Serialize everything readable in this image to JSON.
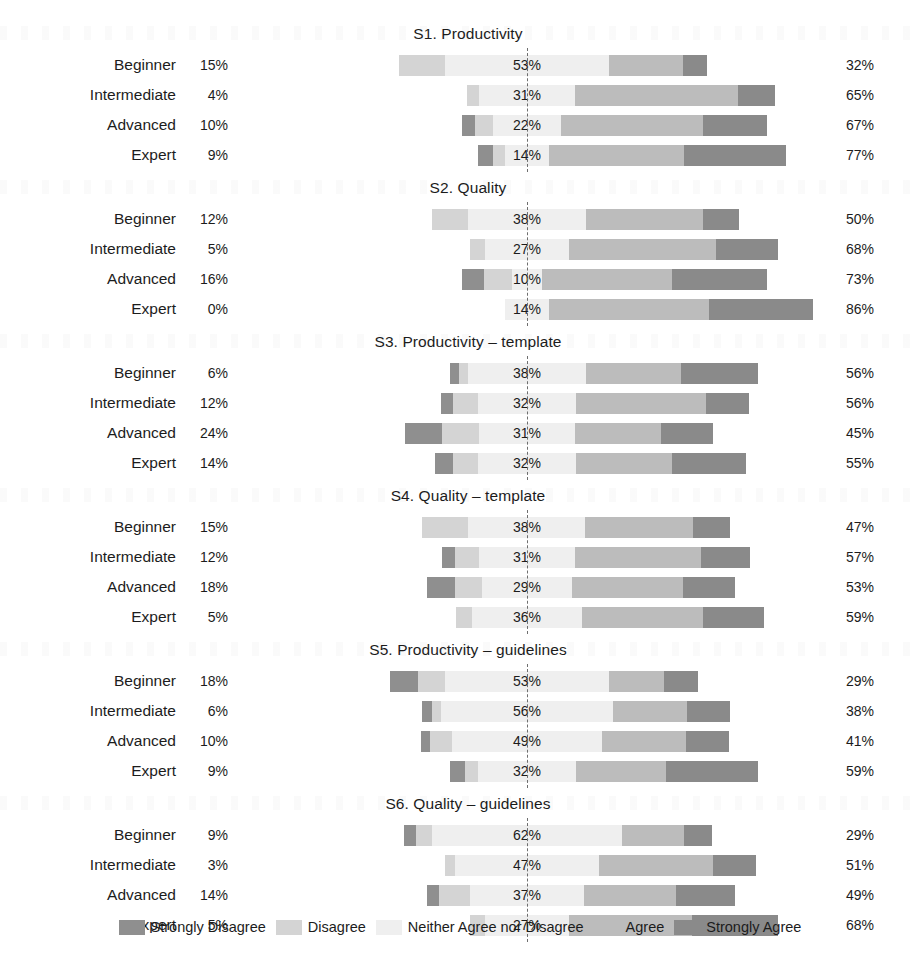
{
  "chart_data": {
    "type": "bar",
    "subtype": "diverging-stacked-likert",
    "title": "",
    "xlabel": "",
    "ylabel": "",
    "grid": false,
    "legend_position": "bottom",
    "categories": [
      "Beginner",
      "Intermediate",
      "Advanced",
      "Expert"
    ],
    "response_levels": [
      "Strongly Disagree",
      "Disagree",
      "Neither Agree nor Disagree",
      "Agree",
      "Strongly Agree"
    ],
    "level_colors": [
      "#8f8f8f",
      "#d4d4d4",
      "#efefef",
      "#bcbcbc",
      "#8a8a8a"
    ],
    "value_unit": "%",
    "panels": [
      {
        "title": "S1. Productivity",
        "rows": [
          {
            "label": "Beginner",
            "disagree_total": "15%",
            "neutral": "53%",
            "agree_total": "32%",
            "strongly_disagree": 0,
            "disagree": 15,
            "neither": 53,
            "agree": 24,
            "strongly_agree": 8
          },
          {
            "label": "Intermediate",
            "disagree_total": "4%",
            "neutral": "31%",
            "agree_total": "65%",
            "strongly_disagree": 0,
            "disagree": 4,
            "neither": 31,
            "agree": 53,
            "strongly_agree": 12
          },
          {
            "label": "Advanced",
            "disagree_total": "10%",
            "neutral": "22%",
            "agree_total": "67%",
            "strongly_disagree": 4,
            "disagree": 6,
            "neither": 22,
            "agree": 46,
            "strongly_agree": 21
          },
          {
            "label": "Expert",
            "disagree_total": "9%",
            "neutral": "14%",
            "agree_total": "77%",
            "strongly_disagree": 5,
            "disagree": 4,
            "neither": 14,
            "agree": 44,
            "strongly_agree": 33
          }
        ]
      },
      {
        "title": "S2. Quality",
        "rows": [
          {
            "label": "Beginner",
            "disagree_total": "12%",
            "neutral": "38%",
            "agree_total": "50%",
            "strongly_disagree": 0,
            "disagree": 12,
            "neither": 38,
            "agree": 38,
            "strongly_agree": 12
          },
          {
            "label": "Intermediate",
            "disagree_total": "5%",
            "neutral": "27%",
            "agree_total": "68%",
            "strongly_disagree": 0,
            "disagree": 5,
            "neither": 27,
            "agree": 48,
            "strongly_agree": 20
          },
          {
            "label": "Advanced",
            "disagree_total": "16%",
            "neutral": "10%",
            "agree_total": "73%",
            "strongly_disagree": 7,
            "disagree": 9,
            "neither": 10,
            "agree": 42,
            "strongly_agree": 31
          },
          {
            "label": "Expert",
            "disagree_total": "0%",
            "neutral": "14%",
            "agree_total": "86%",
            "strongly_disagree": 0,
            "disagree": 0,
            "neither": 14,
            "agree": 52,
            "strongly_agree": 34
          }
        ]
      },
      {
        "title": "S3. Productivity – template",
        "rows": [
          {
            "label": "Beginner",
            "disagree_total": "6%",
            "neutral": "38%",
            "agree_total": "56%",
            "strongly_disagree": 3,
            "disagree": 3,
            "neither": 38,
            "agree": 31,
            "strongly_agree": 25
          },
          {
            "label": "Intermediate",
            "disagree_total": "12%",
            "neutral": "32%",
            "agree_total": "56%",
            "strongly_disagree": 4,
            "disagree": 8,
            "neither": 32,
            "agree": 42,
            "strongly_agree": 14
          },
          {
            "label": "Advanced",
            "disagree_total": "24%",
            "neutral": "31%",
            "agree_total": "45%",
            "strongly_disagree": 12,
            "disagree": 12,
            "neither": 31,
            "agree": 28,
            "strongly_agree": 17
          },
          {
            "label": "Expert",
            "disagree_total": "14%",
            "neutral": "32%",
            "agree_total": "55%",
            "strongly_disagree": 6,
            "disagree": 8,
            "neither": 32,
            "agree": 31,
            "strongly_agree": 24
          }
        ]
      },
      {
        "title": "S4. Quality – template",
        "rows": [
          {
            "label": "Beginner",
            "disagree_total": "15%",
            "neutral": "38%",
            "agree_total": "47%",
            "strongly_disagree": 0,
            "disagree": 15,
            "neither": 38,
            "agree": 35,
            "strongly_agree": 12
          },
          {
            "label": "Intermediate",
            "disagree_total": "12%",
            "neutral": "31%",
            "agree_total": "57%",
            "strongly_disagree": 4,
            "disagree": 8,
            "neither": 31,
            "agree": 41,
            "strongly_agree": 16
          },
          {
            "label": "Advanced",
            "disagree_total": "18%",
            "neutral": "29%",
            "agree_total": "53%",
            "strongly_disagree": 9,
            "disagree": 9,
            "neither": 29,
            "agree": 36,
            "strongly_agree": 17
          },
          {
            "label": "Expert",
            "disagree_total": "5%",
            "neutral": "36%",
            "agree_total": "59%",
            "strongly_disagree": 0,
            "disagree": 5,
            "neither": 36,
            "agree": 39,
            "strongly_agree": 20
          }
        ]
      },
      {
        "title": "S5. Productivity – guidelines",
        "rows": [
          {
            "label": "Beginner",
            "disagree_total": "18%",
            "neutral": "53%",
            "agree_total": "29%",
            "strongly_disagree": 9,
            "disagree": 9,
            "neither": 53,
            "agree": 18,
            "strongly_agree": 11
          },
          {
            "label": "Intermediate",
            "disagree_total": "6%",
            "neutral": "56%",
            "agree_total": "38%",
            "strongly_disagree": 3,
            "disagree": 3,
            "neither": 56,
            "agree": 24,
            "strongly_agree": 14
          },
          {
            "label": "Advanced",
            "disagree_total": "10%",
            "neutral": "49%",
            "agree_total": "41%",
            "strongly_disagree": 3,
            "disagree": 7,
            "neither": 49,
            "agree": 27,
            "strongly_agree": 14
          },
          {
            "label": "Expert",
            "disagree_total": "9%",
            "neutral": "32%",
            "agree_total": "59%",
            "strongly_disagree": 5,
            "disagree": 4,
            "neither": 32,
            "agree": 29,
            "strongly_agree": 30
          }
        ]
      },
      {
        "title": "S6. Quality – guidelines",
        "rows": [
          {
            "label": "Beginner",
            "disagree_total": "9%",
            "neutral": "62%",
            "agree_total": "29%",
            "strongly_disagree": 4,
            "disagree": 5,
            "neither": 62,
            "agree": 20,
            "strongly_agree": 9
          },
          {
            "label": "Intermediate",
            "disagree_total": "3%",
            "neutral": "47%",
            "agree_total": "51%",
            "strongly_disagree": 0,
            "disagree": 3,
            "neither": 47,
            "agree": 37,
            "strongly_agree": 14
          },
          {
            "label": "Advanced",
            "disagree_total": "14%",
            "neutral": "37%",
            "agree_total": "49%",
            "strongly_disagree": 4,
            "disagree": 10,
            "neither": 37,
            "agree": 30,
            "strongly_agree": 19
          },
          {
            "label": "Expert",
            "disagree_total": "5%",
            "neutral": "27%",
            "agree_total": "68%",
            "strongly_disagree": 0,
            "disagree": 5,
            "neither": 27,
            "agree": 40,
            "strongly_agree": 28
          }
        ]
      }
    ]
  },
  "legend": {
    "items": [
      {
        "label": "Strongly Disagree",
        "color": "#8f8f8f",
        "key": "sd"
      },
      {
        "label": "Disagree",
        "color": "#d4d4d4",
        "key": "d"
      },
      {
        "label": "Neither Agree nor Disagree",
        "color": "#efefef",
        "key": "n"
      },
      {
        "label": "Agree",
        "color": "#bcbcbc",
        "key": "a"
      },
      {
        "label": "Strongly Agree",
        "color": "#8a8a8a",
        "key": "sa"
      }
    ]
  },
  "geometry": {
    "center_x_px": 527,
    "px_per_percent": 3.08,
    "bar_height_px": 21,
    "row_height_px": 30
  }
}
